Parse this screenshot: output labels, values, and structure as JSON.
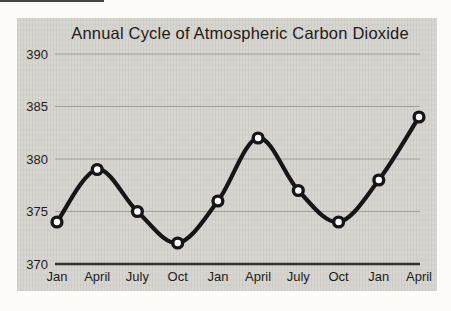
{
  "figure": {
    "title": "Annual Cycle of Atmospheric Carbon Dioxide"
  },
  "chart_data": {
    "type": "line",
    "title": "Annual Cycle of Atmospheric Carbon Dioxide",
    "categories": [
      "Jan",
      "April",
      "July",
      "Oct",
      "Jan",
      "April",
      "July",
      "Oct",
      "Jan",
      "April"
    ],
    "values": [
      374,
      379,
      375,
      372,
      376,
      382,
      377,
      374,
      378,
      384
    ],
    "xlabel": "",
    "ylabel": "",
    "ylim": [
      370,
      390
    ],
    "yticks": [
      370,
      375,
      380,
      385,
      390
    ],
    "grid": true,
    "legend_position": "none",
    "marker": "open-circle",
    "colors": {
      "line": "#161616",
      "marker_fill": "#ffffff",
      "grid": "#a29e98",
      "axis": "#35322e",
      "panel_bg": "#d6d4cf",
      "page_bg": "#fcfbf8",
      "text": "#1e1c1a"
    }
  }
}
